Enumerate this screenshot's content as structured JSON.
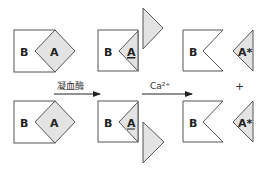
{
  "diagram": {
    "title": "",
    "labels": {
      "b": "B",
      "a": "A",
      "a_star": "A*",
      "plus": "+"
    },
    "arrows": [
      {
        "label": "凝血酶",
        "from": "complex",
        "to": "cleaved"
      },
      {
        "label": "Ca²⁺",
        "from": "cleaved",
        "to": "separated"
      }
    ],
    "rows": [
      {
        "stages": [
          {
            "name": "intact-complex",
            "parts": [
              "B",
              "A"
            ]
          },
          {
            "name": "cleaved-complex",
            "parts": [
              "B",
              "A",
              "fragment"
            ]
          },
          {
            "name": "separated",
            "parts": [
              "B",
              "A*"
            ]
          }
        ]
      },
      {
        "stages": [
          {
            "name": "intact-complex",
            "parts": [
              "B",
              "A"
            ]
          },
          {
            "name": "cleaved-complex",
            "parts": [
              "B",
              "A",
              "fragment"
            ]
          },
          {
            "name": "separated",
            "parts": [
              "B",
              "A*"
            ]
          }
        ]
      }
    ],
    "colors": {
      "outline": "#555555",
      "shade": "#e3e3e3",
      "text": "#222222"
    }
  }
}
